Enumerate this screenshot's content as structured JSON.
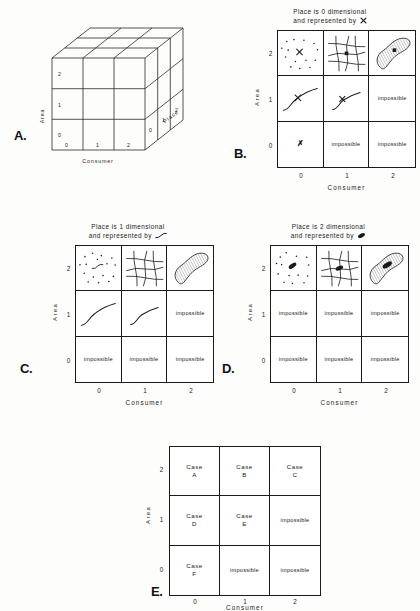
{
  "figure": {
    "axes": {
      "y_label": "Area",
      "x_label": "Consumer",
      "z_label": "Place",
      "ticks_y": [
        "2",
        "1",
        "0"
      ],
      "ticks_x": [
        "0",
        "1",
        "2"
      ],
      "ticks_z": [
        "0",
        "1",
        "2"
      ]
    }
  },
  "panels": {
    "a": {
      "letter": "A.",
      "axis_y": "Area",
      "axis_x": "Consumer",
      "axis_z": "Place",
      "ticks_y": [
        "2",
        "1",
        "0"
      ],
      "ticks_x": [
        "0",
        "1",
        "2"
      ],
      "ticks_z": [
        "0",
        "1",
        "2"
      ]
    },
    "b": {
      "letter": "B.",
      "header_line1": "Place is 0 dimensional",
      "header_line2": "and represented by",
      "header_symbol": "point-x-icon",
      "axis_y": "Area",
      "axis_x": "Consumer",
      "ticks_y": [
        "2",
        "1",
        "0"
      ],
      "ticks_x": [
        "0",
        "1",
        "2"
      ],
      "cells": [
        {
          "id": "b-r2-c0",
          "kind": "icon",
          "icon": "scatter-points-with-x-icon",
          "text": ""
        },
        {
          "id": "b-r2-c1",
          "kind": "icon",
          "icon": "mesh-grid-with-x-icon",
          "text": ""
        },
        {
          "id": "b-r2-c2",
          "kind": "icon",
          "icon": "hatched-blob-with-x-icon",
          "text": ""
        },
        {
          "id": "b-r1-c0",
          "kind": "icon",
          "icon": "s-curve-with-x-icon",
          "text": ""
        },
        {
          "id": "b-r1-c1",
          "kind": "icon",
          "icon": "short-curve-with-x-icon",
          "text": ""
        },
        {
          "id": "b-r1-c2",
          "kind": "text",
          "icon": "",
          "text": "impossible"
        },
        {
          "id": "b-r0-c0",
          "kind": "bigx",
          "icon": "x-mark-icon",
          "text": "✗"
        },
        {
          "id": "b-r0-c1",
          "kind": "text",
          "icon": "",
          "text": "impossible"
        },
        {
          "id": "b-r0-c2",
          "kind": "text",
          "icon": "",
          "text": "impossible"
        }
      ]
    },
    "c": {
      "letter": "C.",
      "header_line1": "Place is 1 dimensional",
      "header_line2": "and represented by",
      "header_symbol": "curve-line-icon",
      "axis_y": "Area",
      "axis_x": "Consumer",
      "ticks_y": [
        "2",
        "1",
        "0"
      ],
      "ticks_x": [
        "0",
        "1",
        "2"
      ],
      "cells": [
        {
          "id": "c-r2-c0",
          "kind": "icon",
          "icon": "scatter-points-with-curve-icon",
          "text": ""
        },
        {
          "id": "c-r2-c1",
          "kind": "icon",
          "icon": "mesh-grid-with-curve-icon",
          "text": ""
        },
        {
          "id": "c-r2-c2",
          "kind": "icon",
          "icon": "hatched-blob-with-curve-icon",
          "text": ""
        },
        {
          "id": "c-r1-c0",
          "kind": "icon",
          "icon": "s-curve-icon",
          "text": ""
        },
        {
          "id": "c-r1-c1",
          "kind": "icon",
          "icon": "s-curve-short-icon",
          "text": ""
        },
        {
          "id": "c-r1-c2",
          "kind": "text",
          "icon": "",
          "text": "impossible"
        },
        {
          "id": "c-r0-c0",
          "kind": "text",
          "icon": "",
          "text": "impossible"
        },
        {
          "id": "c-r0-c1",
          "kind": "text",
          "icon": "",
          "text": "impossible"
        },
        {
          "id": "c-r0-c2",
          "kind": "text",
          "icon": "",
          "text": "impossible"
        }
      ]
    },
    "d": {
      "letter": "D.",
      "header_line1": "Place is 2 dimensional",
      "header_line2": "and represented by",
      "header_symbol": "filled-blob-icon",
      "axis_y": "Area",
      "axis_x": "Consumer",
      "ticks_y": [
        "2",
        "1",
        "0"
      ],
      "ticks_x": [
        "0",
        "1",
        "2"
      ],
      "cells": [
        {
          "id": "d-r2-c0",
          "kind": "icon",
          "icon": "scatter-points-with-blob-icon",
          "text": ""
        },
        {
          "id": "d-r2-c1",
          "kind": "icon",
          "icon": "mesh-grid-with-blob-icon",
          "text": ""
        },
        {
          "id": "d-r2-c2",
          "kind": "icon",
          "icon": "hatched-blob-with-blob-icon",
          "text": ""
        },
        {
          "id": "d-r1-c0",
          "kind": "text",
          "icon": "",
          "text": "impossible"
        },
        {
          "id": "d-r1-c1",
          "kind": "text",
          "icon": "",
          "text": "impossible"
        },
        {
          "id": "d-r1-c2",
          "kind": "text",
          "icon": "",
          "text": "impossible"
        },
        {
          "id": "d-r0-c0",
          "kind": "text",
          "icon": "",
          "text": "impossible"
        },
        {
          "id": "d-r0-c1",
          "kind": "text",
          "icon": "",
          "text": "impossible"
        },
        {
          "id": "d-r0-c2",
          "kind": "text",
          "icon": "",
          "text": "impossible"
        }
      ]
    },
    "e": {
      "letter": "E.",
      "axis_y": "Area",
      "axis_x": "Consumer",
      "ticks_y": [
        "2",
        "1",
        "0"
      ],
      "ticks_x": [
        "0",
        "1",
        "2"
      ],
      "cells": [
        {
          "id": "e-r2-c0",
          "kind": "case",
          "line1": "Case",
          "line2": "A"
        },
        {
          "id": "e-r2-c1",
          "kind": "case",
          "line1": "Case",
          "line2": "B"
        },
        {
          "id": "e-r2-c2",
          "kind": "case",
          "line1": "Case",
          "line2": "C"
        },
        {
          "id": "e-r1-c0",
          "kind": "case",
          "line1": "Case",
          "line2": "D"
        },
        {
          "id": "e-r1-c1",
          "kind": "case",
          "line1": "Case",
          "line2": "E"
        },
        {
          "id": "e-r1-c2",
          "kind": "text",
          "line1": "impossible",
          "line2": ""
        },
        {
          "id": "e-r0-c0",
          "kind": "case",
          "line1": "Case",
          "line2": "F"
        },
        {
          "id": "e-r0-c1",
          "kind": "text",
          "line1": "impossible",
          "line2": ""
        },
        {
          "id": "e-r0-c2",
          "kind": "text",
          "line1": "impossible",
          "line2": ""
        }
      ]
    }
  }
}
